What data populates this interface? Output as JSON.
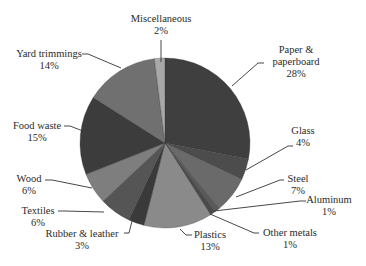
{
  "chart_data": {
    "type": "pie",
    "title": "",
    "start_angle_deg": 0,
    "direction": "clockwise",
    "slices": [
      {
        "label": "Paper & paperboard",
        "value": 28,
        "display": "28%",
        "color": "#3f3f3f"
      },
      {
        "label": "Glass",
        "value": 4,
        "display": "4%",
        "color": "#4c4c4c"
      },
      {
        "label": "Steel",
        "value": 7,
        "display": "7%",
        "color": "#6a6a6a"
      },
      {
        "label": "Aluminum",
        "value": 1,
        "display": "1%",
        "color": "#5a5a5a"
      },
      {
        "label": "Other metals",
        "value": 1,
        "display": "1%",
        "color": "#4a4a4a"
      },
      {
        "label": "Plastics",
        "value": 13,
        "display": "13%",
        "color": "#8a8a8a"
      },
      {
        "label": "Rubber & leather",
        "value": 3,
        "display": "3%",
        "color": "#3a3a3a"
      },
      {
        "label": "Textiles",
        "value": 6,
        "display": "6%",
        "color": "#555555"
      },
      {
        "label": "Wood",
        "value": 6,
        "display": "6%",
        "color": "#7e7e7e"
      },
      {
        "label": "Food waste",
        "value": 15,
        "display": "15%",
        "color": "#3c3c3c"
      },
      {
        "label": "Yard trimmings",
        "value": 14,
        "display": "14%",
        "color": "#707070"
      },
      {
        "label": "Miscellaneous",
        "value": 2,
        "display": "2%",
        "color": "#a8a8a8"
      }
    ],
    "legend": "none",
    "data_labels": "outside with leader lines"
  },
  "labels": {
    "paper": {
      "line1": "Paper &",
      "line2": "paperboard",
      "pct": "28%"
    },
    "glass": {
      "line1": "Glass",
      "pct": "4%"
    },
    "steel": {
      "line1": "Steel",
      "pct": "7%"
    },
    "aluminum": {
      "line1": "Aluminum",
      "pct": "1%"
    },
    "other_metals": {
      "line1": "Other metals",
      "pct": "1%"
    },
    "plastics": {
      "line1": "Plastics",
      "pct": "13%"
    },
    "rubber": {
      "line1": "Rubber & leather",
      "pct": "3%"
    },
    "textiles": {
      "line1": "Textiles",
      "pct": "6%"
    },
    "wood": {
      "line1": "Wood",
      "pct": "6%"
    },
    "food": {
      "line1": "Food waste",
      "pct": "15%"
    },
    "yard": {
      "line1": "Yard trimmings",
      "pct": "14%"
    },
    "misc": {
      "line1": "Miscellaneous",
      "pct": "2%"
    }
  }
}
